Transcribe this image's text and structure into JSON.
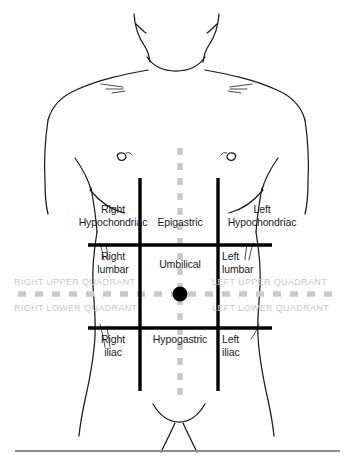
{
  "diagram": {
    "colors": {
      "outline": "#1a1a1a",
      "grid_line": "#000000",
      "dashed_line": "#c9c9c9",
      "quadrant_text": "#c9c9c9",
      "region_text": "#1a1a1a",
      "umbilicus_dot": "#000000",
      "baseline_rule": "#8a8a8a",
      "background": "#ffffff"
    },
    "regions": [
      {
        "id": "right-hypochondriac",
        "label": "Right\nHypochondriac",
        "x": 113,
        "y": 209
      },
      {
        "id": "epigastric",
        "label": "Epigastric",
        "x": 179,
        "y": 216
      },
      {
        "id": "left-hypochondriac",
        "label": "Left\nHypochondriac",
        "x": 260,
        "y": 209
      },
      {
        "id": "right-lumbar",
        "label": "Right\nlumbar",
        "x": 113,
        "y": 250
      },
      {
        "id": "umbilical",
        "label": "Umbilical",
        "x": 179,
        "y": 258
      },
      {
        "id": "left-lumbar",
        "label": "Left\nlumbar",
        "x": 250,
        "y": 250
      },
      {
        "id": "right-iliac",
        "label": "Right\niliac",
        "x": 113,
        "y": 333
      },
      {
        "id": "hypogastric",
        "label": "Hypogastric",
        "x": 179,
        "y": 333
      },
      {
        "id": "left-iliac",
        "label": "Left\niliac",
        "x": 248,
        "y": 333
      }
    ],
    "quadrants": [
      {
        "id": "right-upper-quadrant",
        "label": "RIGHT UPPER QUADRANT",
        "x": 14,
        "y": 277
      },
      {
        "id": "left-upper-quadrant",
        "label": "LEFT UPPER QUADRANT",
        "x": 212,
        "y": 277
      },
      {
        "id": "right-lower-quadrant",
        "label": "RIGHT LOWER QUADRANT",
        "x": 14,
        "y": 303
      },
      {
        "id": "left-lower-quadrant",
        "label": "LEFT LOWER QUADRANT",
        "x": 212,
        "y": 303
      }
    ],
    "markers": {
      "umbilicus": {
        "id": "umbilicus-dot",
        "cx": 180,
        "cy": 294,
        "r": 7.5
      }
    },
    "grid": {
      "vertical_left_x": 140,
      "vertical_right_x": 218,
      "vertical_top_y": 178,
      "vertical_bottom_y": 391,
      "horizontal_upper_y": 245,
      "horizontal_lower_y": 328,
      "horizontal_left_x": 88,
      "horizontal_right_x": 272
    },
    "dashed": {
      "vertical_x": 180,
      "vertical_top_y": 148,
      "vertical_bottom_y": 401,
      "horizontal_y": 294,
      "horizontal_left_x": 18,
      "horizontal_right_x": 336
    },
    "baseline_rule": {
      "x1": 15,
      "x2": 340,
      "y": 451
    }
  }
}
